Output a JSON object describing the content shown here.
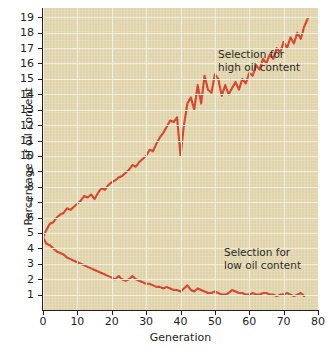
{
  "chart_data": {
    "type": "line",
    "title": "",
    "xlabel": "Generation",
    "ylabel": "Percentage of oil content",
    "xlim": [
      0,
      80
    ],
    "ylim": [
      0,
      19.6
    ],
    "xticks": [
      0,
      10,
      20,
      30,
      40,
      50,
      60,
      70,
      80
    ],
    "yticks": [
      1,
      2,
      3,
      4,
      5,
      6,
      7,
      8,
      9,
      10,
      11,
      12,
      13,
      14,
      15,
      16,
      17,
      18,
      19
    ],
    "grid": true,
    "legend_position": "inline-annotation",
    "line_color": "#d9432a",
    "plot_background": "#e6dab2",
    "grid_color": "#f7f3e4",
    "annotations": [
      {
        "name": "high-selection",
        "text": "Selection for\nhigh oil content",
        "x": 34,
        "y": 16.8
      },
      {
        "name": "low-selection",
        "text": "Selection for\nlow oil content",
        "x": 36,
        "y": 4.0
      }
    ],
    "series": [
      {
        "name": "Selection for high oil content",
        "color": "#d9432a",
        "x": [
          0,
          1,
          2,
          3,
          4,
          5,
          6,
          7,
          8,
          9,
          10,
          11,
          12,
          13,
          14,
          15,
          16,
          17,
          18,
          19,
          20,
          21,
          22,
          23,
          24,
          25,
          26,
          27,
          28,
          29,
          30,
          31,
          32,
          33,
          34,
          35,
          36,
          37,
          38,
          39,
          40,
          41,
          42,
          43,
          44,
          45,
          46,
          47,
          48,
          49,
          50,
          51,
          52,
          53,
          54,
          55,
          56,
          57,
          58,
          59,
          60,
          61,
          62,
          63,
          64,
          65,
          66,
          67,
          68,
          69,
          70,
          71,
          72,
          73,
          74,
          75,
          76,
          77
        ],
        "values": [
          4.7,
          5.2,
          5.6,
          5.7,
          6.0,
          6.2,
          6.3,
          6.6,
          6.5,
          6.7,
          6.9,
          7.1,
          7.4,
          7.3,
          7.5,
          7.2,
          7.6,
          7.9,
          7.8,
          8.1,
          8.3,
          8.4,
          8.6,
          8.7,
          8.9,
          9.1,
          9.4,
          9.3,
          9.6,
          9.8,
          10.0,
          10.4,
          10.3,
          10.8,
          11.2,
          11.5,
          11.9,
          12.3,
          12.2,
          12.5,
          10.0,
          12.0,
          13.4,
          13.8,
          13.0,
          14.6,
          13.4,
          15.2,
          14.3,
          14.1,
          15.3,
          15.0,
          13.9,
          14.6,
          14.0,
          14.4,
          14.8,
          14.3,
          15.0,
          14.7,
          15.4,
          15.2,
          15.9,
          15.6,
          16.3,
          16.0,
          16.6,
          16.3,
          17.0,
          16.7,
          17.4,
          17.0,
          17.7,
          17.3,
          18.0,
          17.6,
          18.4,
          18.9
        ]
      },
      {
        "name": "Selection for low oil content",
        "color": "#d9432a",
        "x": [
          0,
          1,
          2,
          3,
          4,
          5,
          6,
          7,
          8,
          9,
          10,
          11,
          12,
          13,
          14,
          15,
          16,
          17,
          18,
          19,
          20,
          21,
          22,
          23,
          24,
          25,
          26,
          27,
          28,
          29,
          30,
          31,
          32,
          33,
          34,
          35,
          36,
          37,
          38,
          39,
          40,
          41,
          42,
          43,
          44,
          45,
          46,
          47,
          48,
          49,
          50,
          51,
          52,
          53,
          54,
          55,
          56,
          57,
          58,
          59,
          60,
          61,
          62,
          63,
          64,
          65,
          66,
          67,
          68,
          69,
          70,
          71,
          72,
          73,
          74,
          75,
          76
        ],
        "values": [
          4.7,
          4.3,
          4.2,
          4.0,
          3.8,
          3.7,
          3.6,
          3.4,
          3.3,
          3.2,
          3.1,
          3.0,
          2.9,
          2.8,
          2.7,
          2.6,
          2.5,
          2.4,
          2.3,
          2.2,
          2.1,
          2.0,
          2.2,
          2.0,
          1.9,
          2.0,
          2.2,
          2.0,
          1.9,
          1.8,
          1.7,
          1.7,
          1.6,
          1.5,
          1.5,
          1.4,
          1.5,
          1.4,
          1.3,
          1.3,
          1.2,
          1.4,
          1.6,
          1.3,
          1.2,
          1.4,
          1.3,
          1.2,
          1.1,
          1.1,
          1.2,
          1.1,
          1.0,
          1.0,
          1.1,
          1.3,
          1.2,
          1.1,
          1.1,
          1.0,
          1.0,
          1.1,
          1.0,
          1.0,
          1.1,
          1.1,
          1.0,
          1.0,
          0.9,
          1.0,
          1.0,
          1.1,
          1.0,
          0.9,
          1.0,
          1.1,
          0.9
        ]
      }
    ]
  }
}
